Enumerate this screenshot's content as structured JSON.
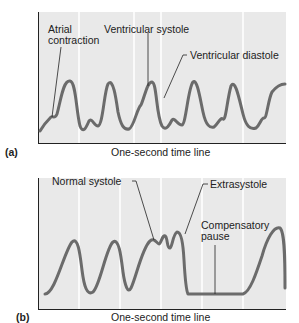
{
  "panels": [
    {
      "id": "a",
      "label": "(a)",
      "axis_title": "One-second time line",
      "annotations": {
        "atrial_contraction_line1": "Atrial",
        "atrial_contraction_line2": "contraction",
        "ventricular_systole": "Ventricular systole",
        "ventricular_diastole": "Ventricular diastole"
      }
    },
    {
      "id": "b",
      "label": "(b)",
      "axis_title": "One-second time line",
      "annotations": {
        "normal_systole": "Normal systole",
        "extrasystole": "Extrasystole",
        "compensatory_pause_line1": "Compensatory",
        "compensatory_pause_line2": "pause"
      }
    }
  ],
  "colors": {
    "panel_bg": "#e9e9e9",
    "trace": "#6b6b6b",
    "gridline": "#ffffff",
    "axis": "#222222"
  }
}
